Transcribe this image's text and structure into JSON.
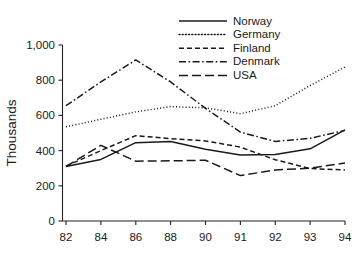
{
  "chart_data": {
    "type": "line",
    "title": "",
    "subtitle": "",
    "xlabel": "",
    "ylabel": "Thousands",
    "x": [
      "82",
      "84",
      "86",
      "88",
      "90",
      "91",
      "92",
      "93",
      "94"
    ],
    "xtick_labels": [
      "82",
      "84",
      "86",
      "88",
      "90",
      "91",
      "92",
      "93",
      "94"
    ],
    "ytick_labels": [
      "0",
      "200",
      "400",
      "600",
      "800",
      "1,000"
    ],
    "ytick_values": [
      0,
      200,
      400,
      600,
      800,
      1000
    ],
    "ylim": [
      0,
      1000
    ],
    "grid": false,
    "legend_position": "top-right",
    "series": [
      {
        "name": "Norway",
        "style": "solid",
        "values": [
          310,
          350,
          445,
          452,
          408,
          375,
          378,
          410,
          518
        ]
      },
      {
        "name": "Germany",
        "style": "dotted",
        "values": [
          535,
          578,
          620,
          650,
          643,
          610,
          655,
          770,
          875
        ]
      },
      {
        "name": "Finland",
        "style": "dashed",
        "values": [
          312,
          400,
          485,
          468,
          455,
          420,
          348,
          298,
          290
        ]
      },
      {
        "name": "Denmark",
        "style": "dash-dot",
        "values": [
          655,
          790,
          915,
          790,
          640,
          505,
          452,
          470,
          515
        ]
      },
      {
        "name": "USA",
        "style": "long-dash",
        "values": [
          310,
          430,
          340,
          342,
          345,
          258,
          290,
          300,
          330
        ]
      }
    ]
  },
  "legend": {
    "entries": [
      {
        "label": "Norway"
      },
      {
        "label": "Germany"
      },
      {
        "label": "Finland"
      },
      {
        "label": "Denmark"
      },
      {
        "label": "USA"
      }
    ]
  }
}
